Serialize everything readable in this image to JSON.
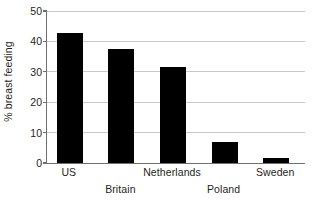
{
  "chart_data": {
    "type": "bar",
    "title": "",
    "subtitle": "",
    "xlabel": "",
    "ylabel": "% breast feeding",
    "categories": [
      "US",
      "Britain",
      "Netherlands",
      "Poland",
      "Sweden"
    ],
    "values": [
      42.8,
      37.5,
      31.7,
      7.0,
      1.5
    ],
    "ylim": [
      0,
      50
    ],
    "yticks": [
      0,
      10,
      20,
      30,
      40,
      50
    ],
    "ytick_labels": [
      "0",
      "10",
      "20",
      "30",
      "40",
      "50"
    ],
    "grid": "horizontal",
    "legend": "none",
    "bar_color": "#000000",
    "gridline_color": "#c9c9c9",
    "axis_color": "#6f6f6f",
    "background_color": "#ffffff",
    "annotations": [],
    "category_label_rows": [
      {
        "label": "US",
        "row": "top"
      },
      {
        "label": "Britain",
        "row": "bottom"
      },
      {
        "label": "Netherlands",
        "row": "top"
      },
      {
        "label": "Poland",
        "row": "bottom"
      },
      {
        "label": "Sweden",
        "row": "top"
      }
    ]
  }
}
